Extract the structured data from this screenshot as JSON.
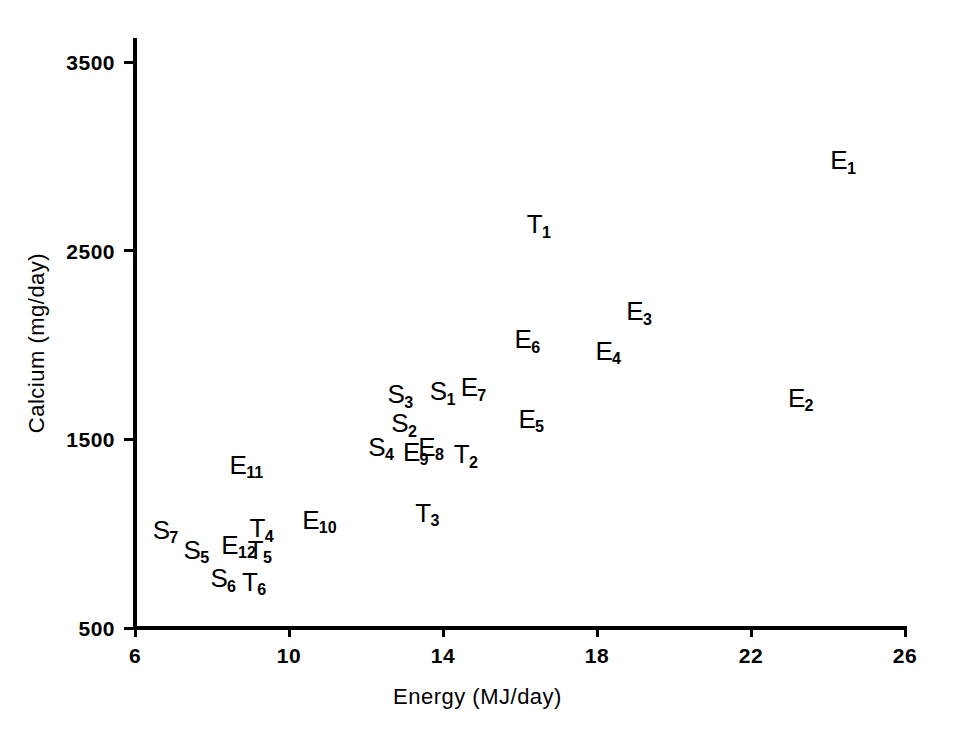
{
  "chart_data": {
    "type": "scatter",
    "title": "",
    "xlabel": "Energy (MJ/day)",
    "ylabel": "Calcium (mg/day)",
    "xlim": [
      6,
      26
    ],
    "ylim": [
      500,
      3500
    ],
    "xticks": [
      6,
      10,
      14,
      18,
      22,
      26
    ],
    "yticks": [
      500,
      1500,
      2500,
      3500
    ],
    "grid": false,
    "legend": "none",
    "marker_style": "text-label",
    "points": [
      {
        "label": "E1",
        "base": "E",
        "sub": "1",
        "x": 24.4,
        "y": 2980
      },
      {
        "label": "E2",
        "base": "E",
        "sub": "2",
        "x": 23.3,
        "y": 1720
      },
      {
        "label": "E3",
        "base": "E",
        "sub": "3",
        "x": 19.1,
        "y": 2180
      },
      {
        "label": "E4",
        "base": "E",
        "sub": "4",
        "x": 18.3,
        "y": 1970
      },
      {
        "label": "E5",
        "base": "E",
        "sub": "5",
        "x": 16.3,
        "y": 1610
      },
      {
        "label": "E6",
        "base": "E",
        "sub": "6",
        "x": 16.2,
        "y": 2030
      },
      {
        "label": "E7",
        "base": "E",
        "sub": "7",
        "x": 14.8,
        "y": 1775
      },
      {
        "label": "E8",
        "base": "E",
        "sub": "8",
        "x": 13.7,
        "y": 1460
      },
      {
        "label": "E9",
        "base": "E",
        "sub": "9",
        "x": 13.3,
        "y": 1435
      },
      {
        "label": "E10",
        "base": "E",
        "sub": "10",
        "x": 10.8,
        "y": 1075
      },
      {
        "label": "E11",
        "base": "E",
        "sub": "11",
        "x": 8.9,
        "y": 1365
      },
      {
        "label": "E12",
        "base": "E",
        "sub": "12",
        "x": 8.7,
        "y": 940
      },
      {
        "label": "S1",
        "base": "S",
        "sub": "1",
        "x": 14.0,
        "y": 1755
      },
      {
        "label": "S2",
        "base": "S",
        "sub": "2",
        "x": 13.0,
        "y": 1585
      },
      {
        "label": "S3",
        "base": "S",
        "sub": "3",
        "x": 12.9,
        "y": 1740
      },
      {
        "label": "S4",
        "base": "S",
        "sub": "4",
        "x": 12.4,
        "y": 1460
      },
      {
        "label": "S5",
        "base": "S",
        "sub": "5",
        "x": 7.6,
        "y": 915
      },
      {
        "label": "S6",
        "base": "S",
        "sub": "6",
        "x": 8.3,
        "y": 765
      },
      {
        "label": "S7",
        "base": "S",
        "sub": "7",
        "x": 6.8,
        "y": 1020
      },
      {
        "label": "T1",
        "base": "T",
        "sub": "1",
        "x": 16.5,
        "y": 2640
      },
      {
        "label": "T2",
        "base": "T",
        "sub": "2",
        "x": 14.6,
        "y": 1420
      },
      {
        "label": "T3",
        "base": "T",
        "sub": "3",
        "x": 13.6,
        "y": 1110
      },
      {
        "label": "T4",
        "base": "T",
        "sub": "4",
        "x": 9.3,
        "y": 1030
      },
      {
        "label": "T5",
        "base": "T",
        "sub": "5",
        "x": 9.25,
        "y": 915
      },
      {
        "label": "T6",
        "base": "T",
        "sub": "6",
        "x": 9.1,
        "y": 745
      }
    ]
  },
  "axes": {
    "x_title": "Energy (MJ/day)",
    "y_title": "Calcium (mg/day)",
    "x_tick_labels": [
      "6",
      "10",
      "14",
      "18",
      "22",
      "26"
    ],
    "y_tick_labels": [
      "3500",
      "2500",
      "1500",
      "500"
    ]
  },
  "colors": {
    "ink": "#000000",
    "background": "#ffffff"
  }
}
